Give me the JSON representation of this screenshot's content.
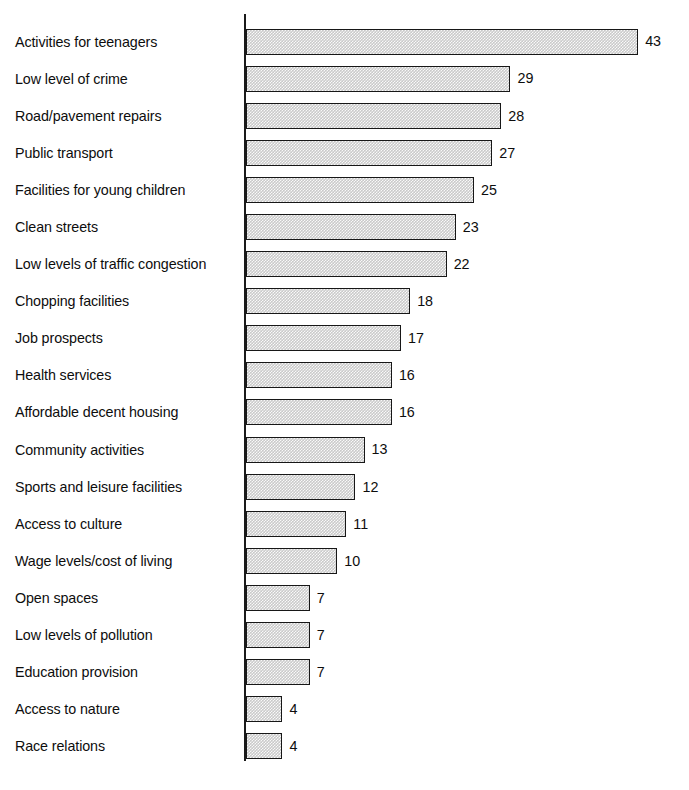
{
  "chart_data": {
    "type": "bar",
    "orientation": "horizontal",
    "title": "",
    "subtitle": "",
    "xlabel": "",
    "ylabel": "",
    "xlim": [
      0,
      43
    ],
    "grid": false,
    "legend": null,
    "value_labels": true,
    "categories": [
      "Activities for teenagers",
      "Low level of crime",
      "Road/pavement repairs",
      "Public transport",
      "Facilities for young children",
      "Clean streets",
      "Low levels of traffic congestion",
      "Chopping facilities",
      "Job prospects",
      "Health services",
      "Affordable decent housing",
      "Community activities",
      "Sports and leisure facilities",
      "Access to culture",
      "Wage levels/cost of living",
      "Open spaces",
      "Low levels of pollution",
      "Education provision",
      "Access to nature",
      "Race relations"
    ],
    "values": [
      43,
      29,
      28,
      27,
      25,
      23,
      22,
      18,
      17,
      16,
      16,
      13,
      12,
      11,
      10,
      7,
      7,
      7,
      4,
      4
    ],
    "bar_fill_color": "#cacaca",
    "bar_border_color": "#171717",
    "axis_color": "#1a1a1a",
    "background_color": "#ffffff",
    "px_per_unit": 9.12
  },
  "figure": {
    "source_note": ""
  }
}
